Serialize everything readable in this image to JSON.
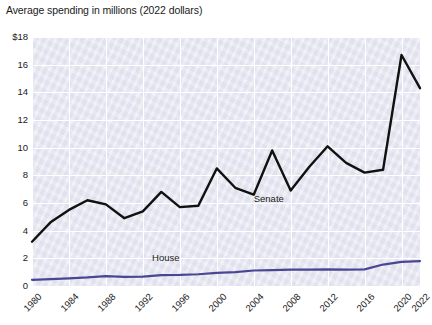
{
  "chart_data": {
    "type": "line",
    "title": "Average spending in millions (2022 dollars)",
    "xlabel": "",
    "ylabel": "",
    "xlim": [
      1980,
      2022
    ],
    "ylim": [
      0,
      18
    ],
    "grid": true,
    "legend_position": "inline-annotation",
    "y_ticks": [
      "$18",
      "16",
      "14",
      "12",
      "10",
      "8",
      "6",
      "4",
      "2",
      "0"
    ],
    "y_tick_values": [
      18,
      16,
      14,
      12,
      10,
      8,
      6,
      4,
      2,
      0
    ],
    "x_ticks": [
      "1980",
      "1984",
      "1988",
      "1992",
      "1996",
      "2000",
      "2004",
      "2008",
      "2012",
      "2016",
      "2020",
      "2022"
    ],
    "x_tick_values": [
      1980,
      1984,
      1988,
      1992,
      1996,
      2000,
      2004,
      2008,
      2012,
      2016,
      2020,
      2022
    ],
    "x": [
      1980,
      1982,
      1984,
      1986,
      1988,
      1990,
      1992,
      1994,
      1996,
      1998,
      2000,
      2002,
      2004,
      2006,
      2008,
      2010,
      2012,
      2014,
      2016,
      2018,
      2020,
      2022
    ],
    "series": [
      {
        "name": "Senate",
        "color": "#111111",
        "values": [
          3.2,
          4.6,
          5.5,
          6.2,
          5.9,
          4.9,
          5.4,
          6.8,
          5.7,
          5.8,
          8.5,
          7.1,
          6.6,
          9.8,
          6.9,
          8.6,
          10.1,
          8.9,
          8.2,
          8.4,
          16.7,
          14.3
        ]
      },
      {
        "name": "House",
        "color": "#4a4694",
        "values": [
          0.45,
          0.5,
          0.55,
          0.62,
          0.72,
          0.66,
          0.68,
          0.78,
          0.8,
          0.85,
          0.95,
          1.0,
          1.12,
          1.15,
          1.18,
          1.18,
          1.2,
          1.18,
          1.2,
          1.55,
          1.75,
          1.8
        ]
      }
    ],
    "annotations": [
      {
        "text": "Senate",
        "x": 2004,
        "y": 6.3
      },
      {
        "text": "House",
        "x": 1993,
        "y": 2.0
      }
    ]
  },
  "colors": {
    "plot_background": "#e9eaf3",
    "grid": "#ffffff",
    "page_background": "#ffffff",
    "text": "#1a1a1a",
    "senate_line": "#111111",
    "house_line": "#4a4694"
  }
}
